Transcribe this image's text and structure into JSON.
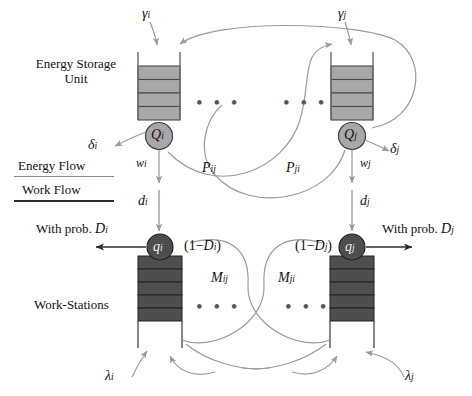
{
  "figure": {
    "type": "diagram"
  },
  "legend": {
    "energy_flow": "Energy Flow",
    "work_flow": "Work Flow",
    "energy_flow_color": "#9a9a9a",
    "work_flow_color": "#2b2b2b"
  },
  "labels": {
    "energy_storage_unit": "Energy Storage\nUnit",
    "energy_storage_line1": "Energy Storage",
    "energy_storage_line2": "Unit",
    "work_stations": "Work-Stations",
    "with_prob_left": "With prob.",
    "with_prob_right": "With prob.",
    "ellipsis": "• • •"
  },
  "nodes": {
    "left": {
      "storage_queue": "Q",
      "storage_sub": "i",
      "work_queue": "q",
      "work_sub": "i",
      "storage_cells": 4,
      "work_cells": 5
    },
    "right": {
      "storage_queue": "Q",
      "storage_sub": "j",
      "work_queue": "q",
      "work_sub": "j",
      "storage_cells": 4,
      "work_cells": 5
    }
  },
  "flows": {
    "gamma_i": {
      "sym": "γ",
      "sub": "i"
    },
    "gamma_j": {
      "sym": "γ",
      "sub": "j"
    },
    "delta_i": {
      "sym": "δ",
      "sub": "i"
    },
    "delta_j": {
      "sym": "δ",
      "sub": "j"
    },
    "w_i": {
      "sym": "w",
      "sub": "i"
    },
    "w_j": {
      "sym": "w",
      "sub": "j"
    },
    "d_i": {
      "sym": "d",
      "sub": "i"
    },
    "d_j": {
      "sym": "d",
      "sub": "j"
    },
    "P_ij": {
      "sym": "P",
      "sub": "ij"
    },
    "P_ji": {
      "sym": "P",
      "sub": "ji"
    },
    "M_ij": {
      "sym": "M",
      "sub": "ij"
    },
    "M_ji": {
      "sym": "M",
      "sub": "ji"
    },
    "D_i": {
      "sym": "D",
      "sub": "i"
    },
    "D_j": {
      "sym": "D",
      "sub": "j"
    },
    "one_minus_D_i": {
      "pre": "(1−",
      "sym": "D",
      "sub": "i",
      "post": ")"
    },
    "one_minus_D_j": {
      "pre": "(1−",
      "sym": "D",
      "sub": "j",
      "post": ")"
    },
    "lambda_i": {
      "sym": "λ",
      "sub": "i"
    },
    "lambda_j": {
      "sym": "λ",
      "sub": "j"
    }
  },
  "colors": {
    "storage_fill": "#a8a8a8",
    "storage_stroke": "#4a4a4a",
    "work_fill": "#4e4e4e",
    "work_stroke": "#262626",
    "q_big_fill": "#a8a8a8",
    "q_small_fill": "#4e4e4e",
    "background": "#ffffff"
  }
}
